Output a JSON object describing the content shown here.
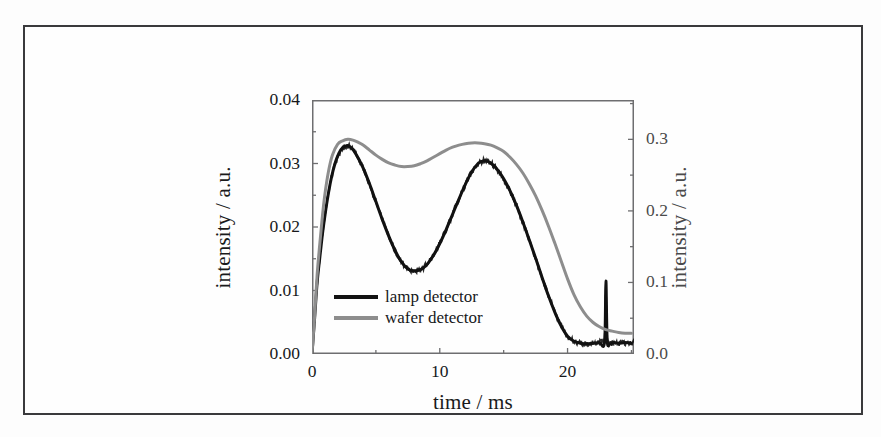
{
  "figure": {
    "border_color": "#3a3a3c",
    "background": "#ffffff"
  },
  "chart_data": {
    "type": "line",
    "title": "",
    "xlabel": "time / ms",
    "ylabel": "intensity / a.u.",
    "ylabel_right": "intensity / a.u.",
    "xlim": [
      0,
      25.2
    ],
    "ylim": [
      0.0,
      0.04
    ],
    "ylim_right": [
      0.0,
      0.355
    ],
    "grid": false,
    "legend_position": "lower left",
    "xticks": [
      0,
      10,
      20
    ],
    "xtick_labels": [
      "0",
      "10",
      "20"
    ],
    "xticks_minor": [
      5,
      15,
      25
    ],
    "yticks": [
      0.0,
      0.01,
      0.02,
      0.03,
      0.04
    ],
    "ytick_labels": [
      "0.00",
      "0.01",
      "0.02",
      "0.03",
      "0.04"
    ],
    "yticks_right": [
      0.0,
      0.1,
      0.2,
      0.3
    ],
    "ytick_labels_right": [
      "0.0",
      "0.1",
      "0.2",
      "0.3"
    ],
    "yticks_right_minor": [
      0.05,
      0.15,
      0.25,
      0.35
    ],
    "series": [
      {
        "name": "lamp detector",
        "color": "#121212",
        "axis": "left",
        "linewidth": 3,
        "noise": 0.00035,
        "x": [
          0.0,
          0.2,
          0.4,
          0.6,
          0.8,
          1.0,
          1.2,
          1.5,
          1.8,
          2.1,
          2.4,
          2.8,
          3.2,
          3.6,
          4.0,
          4.5,
          5.0,
          5.5,
          6.0,
          6.5,
          7.0,
          7.5,
          8.0,
          8.5,
          9.0,
          9.5,
          10.0,
          10.5,
          11.0,
          11.5,
          12.0,
          12.5,
          13.0,
          13.4,
          13.8,
          14.2,
          14.6,
          15.0,
          15.5,
          16.0,
          16.5,
          17.0,
          17.5,
          18.0,
          18.5,
          19.0,
          19.5,
          20.0,
          20.5,
          21.0,
          21.5,
          22.0,
          22.5,
          22.9,
          23.0,
          23.1,
          23.3,
          23.6,
          24.0,
          24.5,
          25.0
        ],
        "y": [
          0.0,
          0.0055,
          0.0112,
          0.015,
          0.0186,
          0.0216,
          0.0243,
          0.0276,
          0.03,
          0.0316,
          0.0325,
          0.0328,
          0.0322,
          0.0309,
          0.0293,
          0.0268,
          0.024,
          0.0212,
          0.0186,
          0.0163,
          0.0145,
          0.0134,
          0.0131,
          0.0133,
          0.0141,
          0.0155,
          0.0174,
          0.0196,
          0.022,
          0.0244,
          0.0267,
          0.0287,
          0.03,
          0.0304,
          0.0303,
          0.0297,
          0.0288,
          0.0276,
          0.0257,
          0.0234,
          0.0208,
          0.018,
          0.0151,
          0.0121,
          0.0092,
          0.0066,
          0.0044,
          0.0028,
          0.002,
          0.0017,
          0.0016,
          0.0017,
          0.0018,
          0.0019,
          0.0115,
          0.0022,
          0.0016,
          0.0018,
          0.0017,
          0.0018,
          0.0017
        ],
        "features": {
          "peak_1": {
            "t": 2.8,
            "value": 0.0328
          },
          "minimum": {
            "t": 8.0,
            "value": 0.0131
          },
          "peak_2": {
            "t": 13.4,
            "value": 0.0304
          },
          "spike": {
            "t": 23.0,
            "value": 0.0115
          },
          "tail_level": 0.0017
        }
      },
      {
        "name": "wafer detector",
        "color": "#8d8d8d",
        "axis": "right",
        "linewidth": 3,
        "noise": 0.0,
        "x": [
          0.0,
          0.2,
          0.4,
          0.6,
          0.8,
          1.0,
          1.3,
          1.6,
          2.0,
          2.4,
          2.8,
          3.2,
          3.6,
          4.0,
          4.5,
          5.0,
          5.5,
          6.0,
          6.5,
          7.0,
          7.5,
          8.0,
          8.5,
          9.0,
          9.5,
          10.0,
          10.5,
          11.0,
          11.5,
          12.0,
          12.5,
          13.0,
          13.5,
          14.0,
          14.5,
          15.0,
          15.5,
          16.0,
          16.5,
          17.0,
          17.5,
          18.0,
          18.5,
          19.0,
          19.5,
          20.0,
          20.5,
          21.0,
          21.5,
          22.0,
          22.5,
          23.0,
          23.5,
          24.0,
          24.5,
          25.0
        ],
        "y_right": [
          0.0,
          0.052,
          0.11,
          0.152,
          0.19,
          0.222,
          0.256,
          0.278,
          0.293,
          0.298,
          0.3,
          0.299,
          0.296,
          0.292,
          0.285,
          0.278,
          0.272,
          0.267,
          0.264,
          0.262,
          0.262,
          0.263,
          0.266,
          0.27,
          0.275,
          0.28,
          0.285,
          0.289,
          0.292,
          0.294,
          0.295,
          0.295,
          0.294,
          0.292,
          0.288,
          0.283,
          0.275,
          0.265,
          0.253,
          0.238,
          0.221,
          0.201,
          0.179,
          0.155,
          0.13,
          0.105,
          0.083,
          0.066,
          0.053,
          0.044,
          0.038,
          0.034,
          0.032,
          0.03,
          0.029,
          0.029
        ],
        "features": {
          "peak_1": {
            "t": 2.8,
            "value": 0.3
          },
          "minimum": {
            "t": 7.3,
            "value": 0.262
          },
          "peak_2": {
            "t": 12.8,
            "value": 0.295
          },
          "end_level": 0.029
        }
      }
    ]
  },
  "legend": {
    "items": [
      {
        "label": "lamp detector",
        "color": "#121212"
      },
      {
        "label": "wafer detector",
        "color": "#8d8d8d"
      }
    ]
  }
}
